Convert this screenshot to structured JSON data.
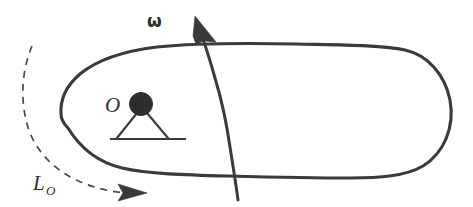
{
  "figure": {
    "background_color": "#ffffff",
    "ink_color": "#3a3a3a",
    "width": 473,
    "height": 207
  },
  "labels": {
    "omega": "ω",
    "point_o": "O",
    "angular_momentum": "L",
    "angular_momentum_subscript": "O"
  },
  "elements": {
    "body_outline_name": "rigid-body-outline",
    "axis_name": "rotation-axis-curve",
    "omega_arrow_name": "omega-arrow-head",
    "dashed_arc_name": "angular-momentum-arc",
    "dashed_arrow_name": "angular-momentum-arrow-head",
    "pivot_dot_name": "pivot-point-marker",
    "support_name": "pivot-support"
  },
  "geometry": {
    "body_path": "M 61 113 C 62 96 74 78 98 65 C 130 47 190 41 250 43 C 310 44 372 44 404 50 C 436 56 452 83 450 117 C 448 150 425 172 392 175 C 350 179 300 178 252 177 C 205 176 155 176 122 170 C 92 164 74 147 61 113 Z",
    "axis_path": "M 238 199 C 236 178 232 150 228 122 C 223 90 214 58 200 27",
    "dashed_path": "M 31 47 C 22 73 23 108 36 140 C 51 175 90 190 129 192",
    "omega_arrow_points": "197 17 214 41 191 38 185 33",
    "dashed_arrow_points": "120 184 146 192 120 200",
    "pivot_center": [
      141,
      104
    ],
    "pivot_radius": 11,
    "ground_y": 139,
    "ground_x1": 110,
    "ground_x2": 186,
    "leg_left_end": [
      118,
      138
    ],
    "leg_right_end": [
      167,
      138
    ],
    "o_label_pos": [
      113,
      112
    ],
    "omega_label_pos": [
      147,
      25
    ],
    "l_label_pos": [
      36,
      184
    ]
  }
}
